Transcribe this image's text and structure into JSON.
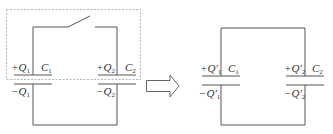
{
  "diagram": {
    "colors": {
      "wire": "#555555",
      "dashed_box": "#b5b5b5",
      "text": "#333333",
      "background": "#ffffff"
    },
    "left_circuit": {
      "description": "Two capacitors connected with an open switch on the top wire, enclosed in a dashed box",
      "switch_state": "open",
      "c1": {
        "name": "C",
        "sub": "1",
        "top_charge_sign": "+",
        "top_charge": "Q",
        "top_sub": "1",
        "bottom_charge_sign": "−",
        "bottom_charge": "Q",
        "bottom_sub": "1"
      },
      "c2": {
        "name": "C",
        "sub": "2",
        "top_charge_sign": "+",
        "top_charge": "Q",
        "top_sub": "2",
        "bottom_charge_sign": "−",
        "bottom_charge": "Q",
        "bottom_sub": "2"
      }
    },
    "arrow": {
      "direction": "right",
      "style": "hollow-block-arrow"
    },
    "right_circuit": {
      "description": "Same two capacitors connected in a closed loop after the switch is closed",
      "c1": {
        "name": "C",
        "sub": "1",
        "top_charge_sign": "+",
        "top_charge": "Q′",
        "top_sub": "1",
        "bottom_charge_sign": "−",
        "bottom_charge": "Q′",
        "bottom_sub": "1"
      },
      "c2": {
        "name": "C",
        "sub": "2",
        "top_charge_sign": "+",
        "top_charge": "Q′",
        "top_sub": "2",
        "bottom_charge_sign": "−",
        "bottom_charge": "Q′",
        "bottom_sub": "2"
      }
    }
  }
}
